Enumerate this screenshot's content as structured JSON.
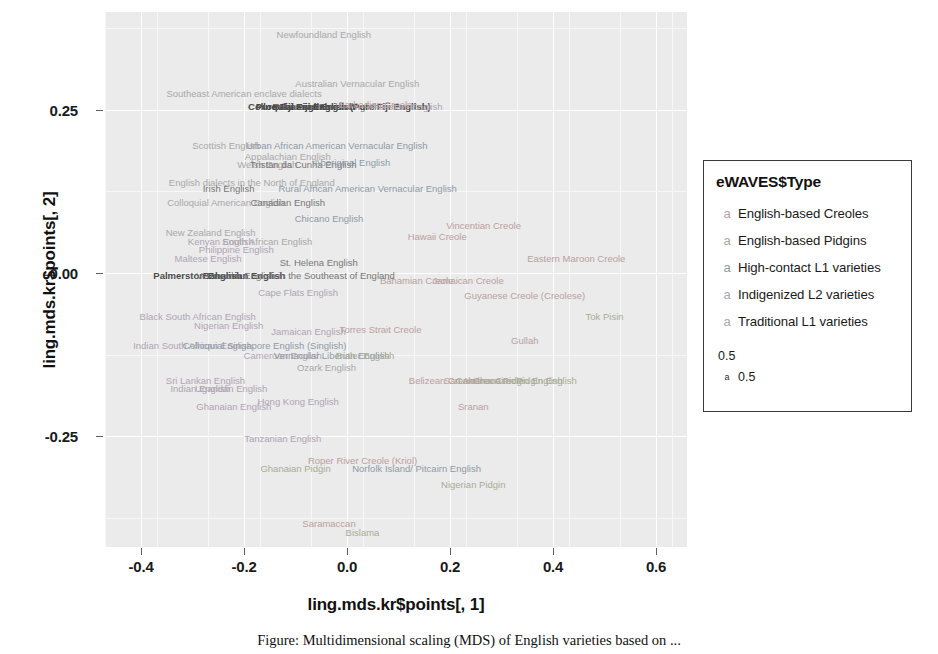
{
  "chart_data": {
    "type": "scatter",
    "title": "",
    "xlabel": "ling.mds.kr$points[, 1]",
    "ylabel": "ling.mds.kr$points[, 2]",
    "xlim": [
      -0.47,
      0.66
    ],
    "ylim": [
      -0.42,
      0.4
    ],
    "xticks": [
      "-0.4",
      "-0.2",
      "0.0",
      "0.2",
      "0.4",
      "0.6"
    ],
    "xtick_values": [
      -0.4,
      -0.2,
      0.0,
      0.2,
      0.4,
      0.6
    ],
    "yticks": [
      "0.25",
      "0.00",
      "-0.25"
    ],
    "ytick_values": [
      0.25,
      0.0,
      -0.25
    ],
    "grid": true,
    "legend_position": "right",
    "note": "Text-label MDS scatter: each variety name is plotted at its MDS coordinates; colour encodes eWAVES$Type.",
    "points": [
      {
        "label": "Newfoundland English",
        "x": -0.045,
        "y": 0.365,
        "group": "trad"
      },
      {
        "label": "Australian Vernacular English",
        "x": 0.02,
        "y": 0.29,
        "group": "trad"
      },
      {
        "label": "Southeast American enclave dialects",
        "x": -0.2,
        "y": 0.275,
        "group": "trad"
      },
      {
        "label": "Pure Fiji English",
        "x": -0.105,
        "y": 0.255,
        "group": "dark"
      },
      {
        "label": "Bahamian English",
        "x": -0.065,
        "y": 0.255,
        "group": "dark"
      },
      {
        "label": "Tristan da Cunha English",
        "x": -0.04,
        "y": 0.255,
        "group": "mid"
      },
      {
        "label": "Colloquial Fiji English (Pure Fiji English)",
        "x": -0.015,
        "y": 0.255,
        "group": "dark"
      },
      {
        "label": "Barbadian Creole",
        "x": 0.055,
        "y": 0.258,
        "group": "creole"
      },
      {
        "label": "Pakistani English",
        "x": 0.115,
        "y": 0.255,
        "group": "l2ind"
      },
      {
        "label": "Scottish English",
        "x": -0.235,
        "y": 0.195,
        "group": "trad"
      },
      {
        "label": "Urban African American Vernacular English",
        "x": -0.02,
        "y": 0.195,
        "group": "l1high"
      },
      {
        "label": "Appalachian English",
        "x": -0.115,
        "y": 0.178,
        "group": "trad"
      },
      {
        "label": "Welsh English",
        "x": -0.155,
        "y": 0.165,
        "group": "trad"
      },
      {
        "label": "Tristan da Cunha English",
        "x": -0.085,
        "y": 0.165,
        "group": "mid"
      },
      {
        "label": "Aboriginal English",
        "x": 0.01,
        "y": 0.168,
        "group": "l1high"
      },
      {
        "label": "English dialects in the North of England",
        "x": -0.185,
        "y": 0.138,
        "group": "trad"
      },
      {
        "label": "Irish English",
        "x": -0.23,
        "y": 0.128,
        "group": "mid"
      },
      {
        "label": "Rural African American Vernacular English",
        "x": 0.04,
        "y": 0.128,
        "group": "l1high"
      },
      {
        "label": "Colloquial American English",
        "x": -0.235,
        "y": 0.108,
        "group": "trad"
      },
      {
        "label": "Canadian English",
        "x": -0.115,
        "y": 0.108,
        "group": "mid"
      },
      {
        "label": "Chicano English",
        "x": -0.035,
        "y": 0.082,
        "group": "l1high"
      },
      {
        "label": "New Zealand English",
        "x": -0.265,
        "y": 0.062,
        "group": "trad"
      },
      {
        "label": "Kenyan English",
        "x": -0.245,
        "y": 0.048,
        "group": "l2ind"
      },
      {
        "label": "South African English",
        "x": -0.155,
        "y": 0.048,
        "group": "trad"
      },
      {
        "label": "Philippine English",
        "x": -0.215,
        "y": 0.035,
        "group": "l2ind"
      },
      {
        "label": "Maltese English",
        "x": -0.27,
        "y": 0.022,
        "group": "l2ind"
      },
      {
        "label": "Hawaii Creole",
        "x": 0.175,
        "y": 0.055,
        "group": "creole"
      },
      {
        "label": "Vincentian Creole",
        "x": 0.265,
        "y": 0.072,
        "group": "creole"
      },
      {
        "label": "St. Helena English",
        "x": -0.055,
        "y": 0.015,
        "group": "mid"
      },
      {
        "label": "Eastern Maroon Creole",
        "x": 0.445,
        "y": 0.022,
        "group": "creole"
      },
      {
        "label": "Bahamian Creole",
        "x": 0.135,
        "y": -0.012,
        "group": "creole"
      },
      {
        "label": "Jamaican Creole",
        "x": 0.235,
        "y": -0.012,
        "group": "creole"
      },
      {
        "label": "Palmerston English",
        "x": -0.29,
        "y": -0.005,
        "group": "dark"
      },
      {
        "label": "Bahamian English",
        "x": -0.2,
        "y": -0.005,
        "group": "dark"
      },
      {
        "label": "Vernacular English in the Southeast of England",
        "x": -0.1,
        "y": -0.005,
        "group": "mid"
      },
      {
        "label": "Cape Flats English",
        "x": -0.095,
        "y": -0.03,
        "group": "l2ind"
      },
      {
        "label": "Guyanese Creole (Creolese)",
        "x": 0.345,
        "y": -0.035,
        "group": "creole"
      },
      {
        "label": "Black South African English",
        "x": -0.29,
        "y": -0.068,
        "group": "l2ind"
      },
      {
        "label": "Nigerian English",
        "x": -0.23,
        "y": -0.082,
        "group": "l2ind"
      },
      {
        "label": "Jamaican English",
        "x": -0.075,
        "y": -0.09,
        "group": "l2ind"
      },
      {
        "label": "Torres Strait Creole",
        "x": 0.065,
        "y": -0.088,
        "group": "creole"
      },
      {
        "label": "Tok Pisin",
        "x": 0.5,
        "y": -0.068,
        "group": "pidgin"
      },
      {
        "label": "Indian South African English",
        "x": -0.3,
        "y": -0.112,
        "group": "l2ind"
      },
      {
        "label": "Colloquial Singapore English (Singlish)",
        "x": -0.16,
        "y": -0.112,
        "group": "l1high"
      },
      {
        "label": "Gullah",
        "x": 0.345,
        "y": -0.105,
        "group": "creole"
      },
      {
        "label": "Cameroon English",
        "x": -0.125,
        "y": -0.128,
        "group": "l2ind"
      },
      {
        "label": "Vernacular Liberian English",
        "x": -0.03,
        "y": -0.128,
        "group": "l1high"
      },
      {
        "label": "Butler English",
        "x": 0.035,
        "y": -0.128,
        "group": "pidgin"
      },
      {
        "label": "Ozark English",
        "x": -0.04,
        "y": -0.145,
        "group": "trad"
      },
      {
        "label": "Sri Lankan English",
        "x": -0.275,
        "y": -0.165,
        "group": "l2ind"
      },
      {
        "label": "Indian English",
        "x": -0.285,
        "y": -0.178,
        "group": "l2ind"
      },
      {
        "label": "Ugandan English",
        "x": -0.225,
        "y": -0.178,
        "group": "l2ind"
      },
      {
        "label": "Belizean Creole",
        "x": 0.185,
        "y": -0.165,
        "group": "creole"
      },
      {
        "label": "San Andres Creole",
        "x": 0.265,
        "y": -0.165,
        "group": "creole"
      },
      {
        "label": "Cameroon Pidgin English",
        "x": 0.315,
        "y": -0.165,
        "group": "pidgin"
      },
      {
        "label": "Ghanaian Pidgin English",
        "x": 0.345,
        "y": -0.165,
        "group": "pidgin"
      },
      {
        "label": "Hong Kong English",
        "x": -0.095,
        "y": -0.198,
        "group": "l2ind"
      },
      {
        "label": "Ghanaian English",
        "x": -0.22,
        "y": -0.205,
        "group": "l2ind"
      },
      {
        "label": "Sranan",
        "x": 0.245,
        "y": -0.205,
        "group": "creole"
      },
      {
        "label": "Tanzanian English",
        "x": -0.125,
        "y": -0.255,
        "group": "l2ind"
      },
      {
        "label": "Roper River Creole (Kriol)",
        "x": 0.03,
        "y": -0.288,
        "group": "creole"
      },
      {
        "label": "Norfolk Island/ Pitcairn English",
        "x": 0.135,
        "y": -0.3,
        "group": "l1high"
      },
      {
        "label": "Ghanaian Pidgin",
        "x": -0.1,
        "y": -0.3,
        "group": "pidgin"
      },
      {
        "label": "Nigerian Pidgin",
        "x": 0.245,
        "y": -0.325,
        "group": "pidgin"
      },
      {
        "label": "Saramaccan",
        "x": -0.035,
        "y": -0.385,
        "group": "creole"
      },
      {
        "label": "Bislama",
        "x": 0.03,
        "y": -0.398,
        "group": "pidgin"
      }
    ]
  },
  "axes": {
    "x_title": "ling.mds.kr$points[, 1]",
    "y_title": "ling.mds.kr$points[, 2]",
    "x_tick_labels": [
      "-0.4",
      "-0.2",
      "0.0",
      "0.2",
      "0.4",
      "0.6"
    ],
    "y_tick_labels": [
      "0.25",
      "0.00",
      "-0.25"
    ]
  },
  "legend": {
    "title": "eWAVES$Type",
    "key_glyph": "a",
    "items": [
      {
        "label": "English-based Creoles",
        "group": "creole"
      },
      {
        "label": "English-based Pidgins",
        "group": "pidgin"
      },
      {
        "label": "High-contact L1 varieties",
        "group": "l1high"
      },
      {
        "label": "Indigenized L2 varieties",
        "group": "l2ind"
      },
      {
        "label": "Traditional L1 varieties",
        "group": "trad"
      }
    ],
    "size_items": [
      {
        "label": "0.5",
        "glyph": ""
      },
      {
        "label": "0.5",
        "glyph": "a"
      }
    ]
  },
  "caption": "Figure: Multidimensional scaling (MDS) of English varieties based on ..."
}
